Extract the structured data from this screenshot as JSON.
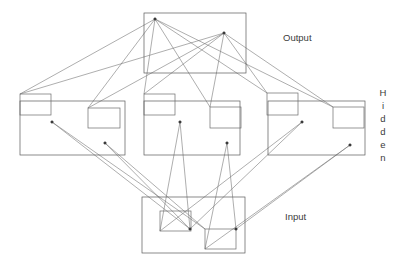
{
  "diagram": {
    "title_alt": "Neural network layer diagram",
    "labels": {
      "output": "Output",
      "hidden": "Hidden",
      "input": "Input"
    },
    "hidden_label_chars": [
      "H",
      "i",
      "d",
      "d",
      "e",
      "n"
    ],
    "colors": {
      "background": "#ffffff",
      "box_stroke": "#5a5a5a",
      "unit_stroke": "#6b6b6b",
      "connection": "#777777",
      "node": "#3a3a3a",
      "text": "#3b3b3b"
    },
    "layers": [
      {
        "name": "output",
        "group_boxes": [
          {
            "x": 144,
            "y": 13,
            "w": 102,
            "h": 60
          }
        ],
        "unit_boxes": [],
        "nodes": [
          {
            "id": "o1",
            "x": 155,
            "y": 19
          },
          {
            "id": "o2",
            "x": 224,
            "y": 33
          }
        ]
      },
      {
        "name": "hidden",
        "group_boxes": [
          {
            "x": 20,
            "y": 101,
            "w": 105,
            "h": 54
          },
          {
            "x": 144,
            "y": 101,
            "w": 96,
            "h": 54
          },
          {
            "x": 268,
            "y": 101,
            "w": 97,
            "h": 54
          }
        ],
        "unit_boxes": [
          {
            "x": 20,
            "y": 94,
            "w": 31,
            "h": 21
          },
          {
            "x": 88,
            "y": 108,
            "w": 32,
            "h": 20
          },
          {
            "x": 144,
            "y": 94,
            "w": 31,
            "h": 21
          },
          {
            "x": 210,
            "y": 107,
            "w": 31,
            "h": 21
          },
          {
            "x": 267,
            "y": 93,
            "w": 31,
            "h": 22
          },
          {
            "x": 333,
            "y": 107,
            "w": 31,
            "h": 21
          }
        ],
        "nodes": [
          {
            "id": "h1",
            "x": 52,
            "y": 122
          },
          {
            "id": "h2",
            "x": 105,
            "y": 143
          },
          {
            "id": "h3",
            "x": 180,
            "y": 122
          },
          {
            "id": "h4",
            "x": 227,
            "y": 143
          },
          {
            "id": "h5",
            "x": 302,
            "y": 122
          },
          {
            "id": "h6",
            "x": 350,
            "y": 145
          }
        ]
      },
      {
        "name": "input",
        "group_boxes": [
          {
            "x": 142,
            "y": 197,
            "w": 103,
            "h": 56
          }
        ],
        "unit_boxes": [
          {
            "x": 160,
            "y": 211,
            "w": 31,
            "h": 20
          },
          {
            "x": 205,
            "y": 229,
            "w": 31,
            "h": 20
          }
        ],
        "nodes": [
          {
            "id": "i1",
            "x": 190,
            "y": 229
          },
          {
            "id": "i2",
            "x": 236,
            "y": 229
          }
        ]
      }
    ],
    "connections": [
      {
        "from": "o1",
        "to_x": 20,
        "to_y": 94
      },
      {
        "from": "o1",
        "to_x": 88,
        "to_y": 108
      },
      {
        "from": "o1",
        "to_x": 144,
        "to_y": 94
      },
      {
        "from": "o1",
        "to_x": 210,
        "to_y": 107
      },
      {
        "from": "o1",
        "to_x": 267,
        "to_y": 93
      },
      {
        "from": "o1",
        "to_x": 333,
        "to_y": 107
      },
      {
        "from": "o2",
        "to_x": 20,
        "to_y": 94
      },
      {
        "from": "o2",
        "to_x": 88,
        "to_y": 108
      },
      {
        "from": "o2",
        "to_x": 144,
        "to_y": 94
      },
      {
        "from": "o2",
        "to_x": 210,
        "to_y": 107
      },
      {
        "from": "o2",
        "to_x": 267,
        "to_y": 93
      },
      {
        "from": "o2",
        "to_x": 333,
        "to_y": 107
      },
      {
        "from": "h1",
        "to_x": 190,
        "to_y": 229
      },
      {
        "from": "h1",
        "to_x": 205,
        "to_y": 229
      },
      {
        "from": "h2",
        "to_x": 190,
        "to_y": 229
      },
      {
        "from": "h2",
        "to_x": 205,
        "to_y": 229
      },
      {
        "from": "h3",
        "to_x": 160,
        "to_y": 231
      },
      {
        "from": "h3",
        "to_x": 190,
        "to_y": 229
      },
      {
        "from": "h4",
        "to_x": 205,
        "to_y": 249
      },
      {
        "from": "h4",
        "to_x": 236,
        "to_y": 229
      },
      {
        "from": "h5",
        "to_x": 160,
        "to_y": 231
      },
      {
        "from": "h5",
        "to_x": 190,
        "to_y": 229
      },
      {
        "from": "h6",
        "to_x": 205,
        "to_y": 249
      },
      {
        "from": "h6",
        "to_x": 236,
        "to_y": 229
      }
    ]
  }
}
